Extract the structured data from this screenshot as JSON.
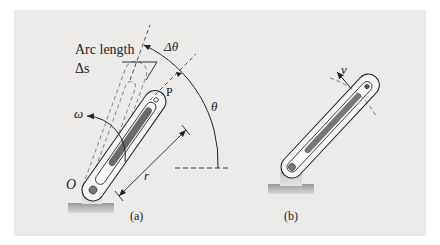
{
  "figure": {
    "background_color": "#ecebe9",
    "ink_color": "#222222",
    "slot_color": "#555555",
    "panels": [
      {
        "id": "a",
        "caption": "(a)",
        "labels": {
          "arc_length_line1": "Arc length",
          "arc_length_line2": "Δs",
          "delta_theta": "Δθ",
          "theta": "θ",
          "omega": "ω",
          "origin": "O",
          "point": "P",
          "radius": "r"
        }
      },
      {
        "id": "b",
        "caption": "(b)",
        "labels": {
          "velocity": "v"
        }
      }
    ]
  }
}
